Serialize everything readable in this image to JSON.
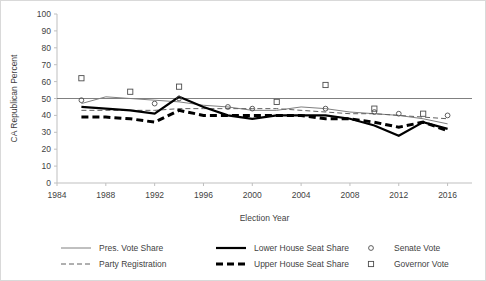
{
  "chart_data": {
    "type": "line",
    "title": "",
    "xlabel": "Election Year",
    "ylabel": "CA Republican Percent",
    "xlim": [
      1984,
      2018
    ],
    "ylim": [
      0,
      100
    ],
    "grid": false,
    "legend_position": "bottom",
    "yticks": [
      0,
      10,
      20,
      30,
      40,
      50,
      60,
      70,
      80,
      90,
      100
    ],
    "xticks": [
      1984,
      1988,
      1992,
      1996,
      2000,
      2004,
      2008,
      2012,
      2016
    ],
    "reference_line": {
      "label": "50 percent",
      "value": 50,
      "color": "#808080"
    },
    "series": [
      {
        "name": "Pres. Vote Share",
        "style": "solid-thin",
        "color": "#808080",
        "marker": "none",
        "x": [
          1986,
          1988,
          1990,
          1992,
          1994,
          1996,
          1998,
          2000,
          2002,
          2004,
          2006,
          2008,
          2010,
          2012,
          2014,
          2016
        ],
        "values": [
          47,
          51,
          50,
          49,
          48,
          46,
          45,
          43,
          43,
          45,
          44,
          42,
          41,
          40,
          38,
          35
        ]
      },
      {
        "name": "Party Registration",
        "style": "dashed-thin",
        "color": "#606060",
        "marker": "none",
        "x": [
          1986,
          1988,
          1990,
          1992,
          1994,
          1996,
          1998,
          2000,
          2002,
          2004,
          2006,
          2008,
          2010,
          2012,
          2014,
          2016
        ],
        "values": [
          43,
          43,
          43,
          43,
          44,
          44,
          44,
          44,
          44,
          43,
          42,
          41,
          41,
          40,
          39,
          38
        ]
      },
      {
        "name": "Lower House Seat Share",
        "style": "solid-thick",
        "color": "#000000",
        "marker": "none",
        "x": [
          1986,
          1988,
          1990,
          1992,
          1994,
          1996,
          1998,
          2000,
          2002,
          2004,
          2006,
          2008,
          2010,
          2012,
          2014,
          2016
        ],
        "values": [
          45,
          44,
          43,
          41,
          51,
          45,
          40,
          38,
          40,
          40,
          40,
          38,
          34,
          28,
          36,
          32
        ]
      },
      {
        "name": "Upper House Seat Share",
        "style": "dashed-thick",
        "color": "#000000",
        "marker": "none",
        "x": [
          1986,
          1988,
          1990,
          1992,
          1994,
          1996,
          1998,
          2000,
          2002,
          2004,
          2006,
          2008,
          2010,
          2012,
          2014,
          2016
        ],
        "values": [
          39,
          39,
          38,
          36,
          43,
          40,
          40,
          40,
          40,
          40,
          38,
          38,
          36,
          33,
          36,
          31
        ]
      },
      {
        "name": "Senate Vote",
        "style": "marker-only",
        "color": "#4d4d4d",
        "marker": "circle",
        "x": [
          1986,
          1992,
          1994,
          1998,
          2000,
          2006,
          2010,
          2012,
          2016
        ],
        "values": [
          49,
          47,
          50,
          45,
          44,
          44,
          42,
          41,
          40
        ]
      },
      {
        "name": "Governor Vote",
        "style": "marker-only",
        "color": "#4d4d4d",
        "marker": "square",
        "x": [
          1986,
          1990,
          1994,
          2002,
          2006,
          2010,
          2014
        ],
        "values": [
          62,
          54,
          57,
          48,
          58,
          44,
          41
        ]
      }
    ]
  },
  "legend": {
    "items": [
      {
        "label": "Pres. Vote Share",
        "glyph": "solid-thin"
      },
      {
        "label": "Party Registration",
        "glyph": "dashed-thin"
      },
      {
        "label": "Lower House Seat Share",
        "glyph": "solid-thick"
      },
      {
        "label": "Upper House Seat Share",
        "glyph": "dashed-thick"
      },
      {
        "label": "Senate Vote",
        "glyph": "circle"
      },
      {
        "label": "Governor Vote",
        "glyph": "square"
      }
    ]
  }
}
